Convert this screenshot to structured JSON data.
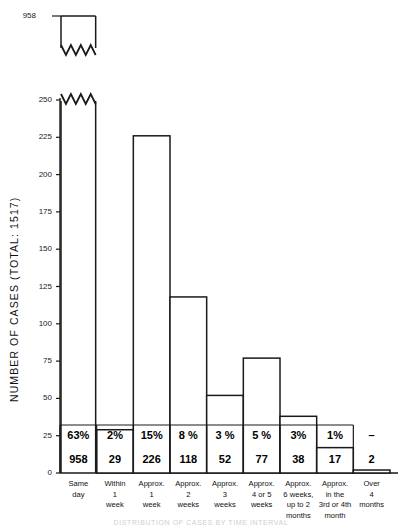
{
  "chart_data": {
    "type": "bar",
    "title": "",
    "subtitle": "",
    "xlabel": "",
    "ylabel": "NUMBER OF CASES  (TOTAL: 1517)",
    "ylim": [
      0,
      250
    ],
    "yticks": [
      0,
      25,
      50,
      75,
      100,
      125,
      150,
      175,
      200,
      225,
      250
    ],
    "ytick_labels": [
      "0",
      "25",
      "50",
      "75",
      "100",
      "125",
      "150",
      "175",
      "200",
      "225",
      "250"
    ],
    "grid": false,
    "legend": null,
    "axis_break": {
      "present": true,
      "break_label": "958",
      "note": "First bar is truncated with a zigzag break; its full value 958 is shown as a detached segment at top"
    },
    "total": 1517,
    "categories": [
      "Same day",
      "Within 1 week",
      "Approx. 1 week",
      "Approx. 2 weeks",
      "Approx. 3 weeks",
      "Approx. 4 or 5 weeks",
      "Approx. 6 weeks, up to 2 months",
      "Approx. in the 3rd or 4th month",
      "Over 4 months"
    ],
    "category_lines": [
      [
        "Same",
        "day"
      ],
      [
        "Within",
        "1",
        "week"
      ],
      [
        "Approx.",
        "1",
        "week"
      ],
      [
        "Approx.",
        "2",
        "weeks"
      ],
      [
        "Approx.",
        "3",
        "weeks"
      ],
      [
        "Approx.",
        "4 or 5",
        "weeks"
      ],
      [
        "Approx.",
        "6 weeks,",
        "up to 2",
        "months"
      ],
      [
        "Approx.",
        "in the",
        "3rd or 4th",
        "month"
      ],
      [
        "Over",
        "4",
        "months"
      ]
    ],
    "values": [
      958,
      29,
      226,
      118,
      52,
      77,
      38,
      17,
      2
    ],
    "percents": [
      "63%",
      "2%",
      "15%",
      "8 %",
      "3 %",
      "5 %",
      "3%",
      "1%",
      "–"
    ],
    "counts": [
      "958",
      "29",
      "226",
      "118",
      "52",
      "77",
      "38",
      "17",
      "2"
    ],
    "series": [
      {
        "name": "Number of cases",
        "values": [
          958,
          29,
          226,
          118,
          52,
          77,
          38,
          17,
          2
        ]
      }
    ]
  },
  "figure": {
    "caption": "DISTRIBUTION OF CASES BY TIME INTERVAL",
    "bar_face_color": "#ffffff",
    "bar_edge_color": "#1a1a1a",
    "axis_color": "#1a1a1a",
    "background": "#ffffff"
  }
}
